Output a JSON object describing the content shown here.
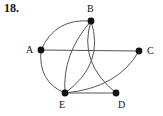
{
  "figure": {
    "problem_number": "18.",
    "background_color": "#ffffff",
    "edge_color": "#555555",
    "vertex_color": "#111111",
    "label_color": "#111111",
    "width": 163,
    "height": 116
  },
  "graph": {
    "type": "undirected-graph",
    "vertices": [
      {
        "id": "A",
        "label": "A",
        "x": 41,
        "y": 50,
        "label_x": 26,
        "label_y": 45
      },
      {
        "id": "B",
        "label": "B",
        "x": 91,
        "y": 21,
        "label_x": 87,
        "label_y": 4
      },
      {
        "id": "C",
        "label": "C",
        "x": 139,
        "y": 51,
        "label_x": 147,
        "label_y": 46
      },
      {
        "id": "D",
        "label": "D",
        "x": 116,
        "y": 93,
        "label_x": 118,
        "label_y": 100
      },
      {
        "id": "E",
        "label": "E",
        "x": 65,
        "y": 93,
        "label_x": 59,
        "label_y": 100
      }
    ],
    "edges": [
      {
        "id": "A-C",
        "from": "A",
        "to": "C",
        "shape": "straight",
        "cx": 90,
        "cy": 50
      },
      {
        "id": "E-D",
        "from": "E",
        "to": "D",
        "shape": "straight",
        "cx": 90,
        "cy": 93
      },
      {
        "id": "A-B",
        "from": "A",
        "to": "B",
        "shape": "curve",
        "cx": 55,
        "cy": 18
      },
      {
        "id": "A-E",
        "from": "A",
        "to": "E",
        "shape": "curve",
        "cx": 38,
        "cy": 82
      },
      {
        "id": "B-E",
        "from": "B",
        "to": "E",
        "shape": "curve",
        "cx": 105,
        "cy": 64
      },
      {
        "id": "B-D",
        "from": "B",
        "to": "D",
        "shape": "curve",
        "cx": 78,
        "cy": 62
      },
      {
        "id": "B-E2",
        "from": "B",
        "to": "E",
        "shape": "curve",
        "cx": 62,
        "cy": 54
      },
      {
        "id": "C-E",
        "from": "C",
        "to": "E",
        "shape": "curve",
        "cx": 118,
        "cy": 88
      }
    ]
  }
}
